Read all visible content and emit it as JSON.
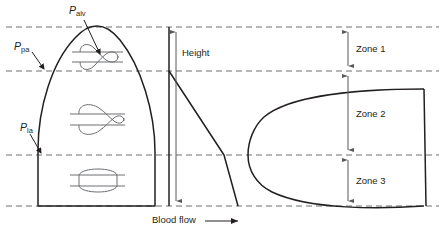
{
  "figure": {
    "labels": {
      "p_alv": "P",
      "p_alv_sub": "alv",
      "p_pa": "P",
      "p_pa_sub": "pa",
      "p_la": "P",
      "p_la_sub": "la",
      "height": "Height",
      "blood_flow": "Blood flow",
      "zone1": "Zone 1",
      "zone2": "Zone 2",
      "zone3": "Zone 3"
    },
    "colors": {
      "line": "#231f20",
      "dashed": "#6d6e71",
      "arrow": "#58595b",
      "background": "#ffffff",
      "capillary": "#6d6e71"
    },
    "geometry": {
      "dashed_line_top_y": 27,
      "dashed_line_ppa_y": 71,
      "dashed_line_pla_y": 155,
      "dashed_line_bottom_y": 206,
      "lung_bottom_y": 206,
      "lung_left_x": 38,
      "lung_right_x": 155,
      "lung_apex_x": 97,
      "divider_x": 169,
      "zone_arrow_x": 348,
      "flow_curve_left_x": 248,
      "flow_curve_right_x": 424
    },
    "capillaries": [
      {
        "name": "capillary-zone1",
        "state": "collapsed",
        "x": 97,
        "y": 57
      },
      {
        "name": "capillary-zone2",
        "state": "partially-collapsed",
        "x": 97,
        "y": 119
      },
      {
        "name": "capillary-zone3",
        "state": "open",
        "x": 97,
        "y": 180
      }
    ]
  }
}
